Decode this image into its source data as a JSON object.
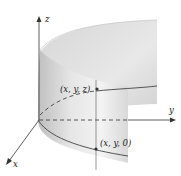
{
  "figure": {
    "axes": {
      "x_label": "x",
      "y_label": "y",
      "z_label": "z"
    },
    "points": [
      {
        "label": "(x, y, z)",
        "role": "point-on-surface"
      },
      {
        "label": "(x, y, 0)",
        "role": "projection-in-xy-plane"
      }
    ],
    "colors": {
      "surface_light": "#f2f2f2",
      "surface_mid": "#d9d9d9",
      "surface_dark": "#bdbdbd",
      "curve": "#444444",
      "axis": "#333333"
    }
  }
}
